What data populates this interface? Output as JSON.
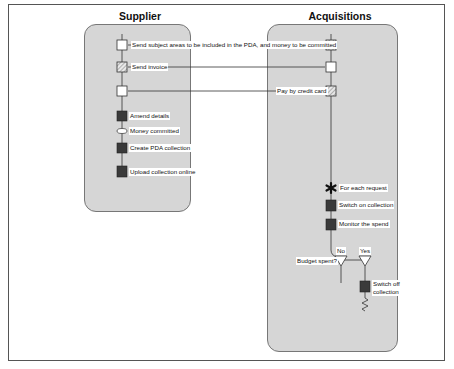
{
  "lanes": {
    "supplier": {
      "title": "Supplier"
    },
    "acquisitions": {
      "title": "Acquisitions"
    }
  },
  "messages": [
    {
      "label": "Send subject areas to be included in the PDA, and money to be committed"
    },
    {
      "label": "Send invoice"
    },
    {
      "label": "Pay by credit card"
    }
  ],
  "supplier_steps": [
    {
      "label": "Amend details",
      "shape": "dark-square"
    },
    {
      "label": "Money committed",
      "shape": "oval"
    },
    {
      "label": "Create PDA collection",
      "shape": "dark-square"
    },
    {
      "label": "Upload collection online",
      "shape": "dark-square"
    }
  ],
  "acquisitions_steps": [
    {
      "label": "For each request",
      "shape": "asterisk"
    },
    {
      "label": "Switch on collection",
      "shape": "dark-square"
    },
    {
      "label": "Monitor the spend",
      "shape": "dark-square"
    }
  ],
  "decision": {
    "question": "Budget spent?",
    "no_label": "No",
    "yes_label": "Yes",
    "yes_action_line1": "Switch off",
    "yes_action_line2": "collection"
  },
  "colors": {
    "lane_fill": "#d6d6d6",
    "dark_box": "#3a3a3a",
    "line": "#333333"
  }
}
